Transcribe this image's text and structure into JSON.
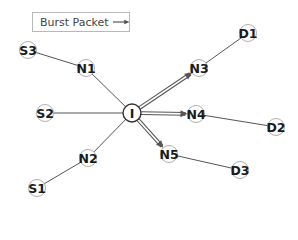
{
  "legend": {
    "label": "Burst Packet",
    "icon": "arrow-right-icon"
  },
  "colors": {
    "edge": "#555555",
    "burst": "#555555",
    "node_border": "#999999",
    "text": "#1a1a1a"
  },
  "nodes": [
    {
      "id": "S3",
      "label": "S3",
      "x": 28,
      "y": 50
    },
    {
      "id": "N1",
      "label": "N1",
      "x": 86,
      "y": 68
    },
    {
      "id": "S2",
      "label": "S2",
      "x": 45,
      "y": 113
    },
    {
      "id": "I",
      "label": "I",
      "x": 132,
      "y": 113
    },
    {
      "id": "N2",
      "label": "N2",
      "x": 88,
      "y": 158
    },
    {
      "id": "S1",
      "label": "S1",
      "x": 37,
      "y": 188
    },
    {
      "id": "D1",
      "label": "D1",
      "x": 248,
      "y": 33
    },
    {
      "id": "N3",
      "label": "N3",
      "x": 199,
      "y": 68
    },
    {
      "id": "N4",
      "label": "N4",
      "x": 196,
      "y": 114
    },
    {
      "id": "D2",
      "label": "D2",
      "x": 276,
      "y": 127
    },
    {
      "id": "N5",
      "label": "N5",
      "x": 169,
      "y": 154
    },
    {
      "id": "D3",
      "label": "D3",
      "x": 240,
      "y": 170
    }
  ],
  "edges": [
    {
      "from": "S3",
      "to": "N1",
      "type": "link"
    },
    {
      "from": "N1",
      "to": "I",
      "type": "link"
    },
    {
      "from": "S2",
      "to": "I",
      "type": "link"
    },
    {
      "from": "S1",
      "to": "N2",
      "type": "link"
    },
    {
      "from": "N2",
      "to": "I",
      "type": "link"
    },
    {
      "from": "N3",
      "to": "D1",
      "type": "link"
    },
    {
      "from": "N4",
      "to": "D2",
      "type": "link"
    },
    {
      "from": "N5",
      "to": "D3",
      "type": "link"
    },
    {
      "from": "I",
      "to": "N3",
      "type": "burst"
    },
    {
      "from": "I",
      "to": "N4",
      "type": "burst"
    },
    {
      "from": "I",
      "to": "N5",
      "type": "burst"
    }
  ]
}
